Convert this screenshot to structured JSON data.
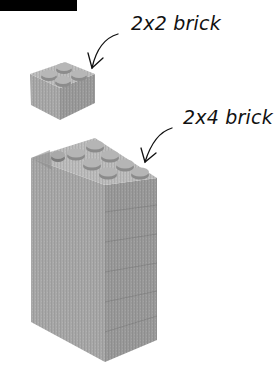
{
  "figure": {
    "top_bar": "black header bar",
    "callouts": [
      {
        "label": "2x2 brick",
        "target": "small brick"
      },
      {
        "label": "2x4 brick",
        "target": "top brick of stack"
      }
    ],
    "objects": [
      {
        "name": "2x2 brick",
        "studs": 4,
        "rows": 2,
        "cols": 2
      },
      {
        "name": "brick stack",
        "studs_on_top": 8,
        "rows": 2,
        "cols": 4,
        "layers": 6
      }
    ],
    "colors": {
      "brick_top": "#bdbdbd",
      "brick_left": "#a9a9a9",
      "brick_right": "#9a9a9a",
      "stud": "#b4b4b4",
      "stud_shadow": "#8a8a8a",
      "ink": "#111111"
    }
  }
}
